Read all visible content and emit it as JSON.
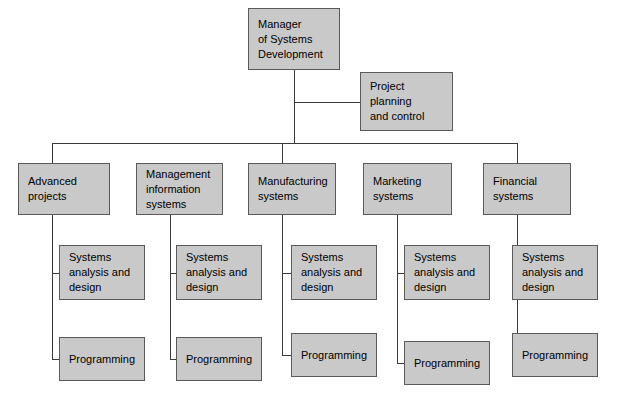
{
  "diagram": {
    "colors": {
      "box_fill": "#c9c9c9",
      "box_border": "#5a5a5a",
      "connector": "#3a3a3a",
      "background": "#ffffff",
      "text": "#000000"
    },
    "root": {
      "label_lines": [
        "Manager",
        "of Systems",
        "Development"
      ],
      "label": "Manager of Systems Development"
    },
    "staff": {
      "label_lines": [
        "Project",
        "planning",
        "and control"
      ],
      "label": "Project planning and control"
    },
    "divisions": [
      {
        "label": "Advanced projects",
        "label_lines": [
          "Advanced",
          "projects"
        ],
        "children": [
          {
            "label": "Systems analysis and design",
            "label_lines": [
              "Systems",
              "analysis and",
              "design"
            ]
          },
          {
            "label": "Programming",
            "label_lines": [
              "Programming"
            ]
          }
        ]
      },
      {
        "label": "Management information systems",
        "label_lines": [
          "Management",
          "information",
          "systems"
        ],
        "children": [
          {
            "label": "Systems analysis and design",
            "label_lines": [
              "Systems",
              "analysis and",
              "design"
            ]
          },
          {
            "label": "Programming",
            "label_lines": [
              "Programming"
            ]
          }
        ]
      },
      {
        "label": "Manufacturing systems",
        "label_lines": [
          "Manufacturing",
          "systems"
        ],
        "children": [
          {
            "label": "Systems analysis and design",
            "label_lines": [
              "Systems",
              "analysis and",
              "design"
            ]
          },
          {
            "label": "Programming",
            "label_lines": [
              "Programming"
            ]
          }
        ]
      },
      {
        "label": "Marketing systems",
        "label_lines": [
          "Marketing",
          "systems"
        ],
        "children": [
          {
            "label": "Systems analysis and design",
            "label_lines": [
              "Systems",
              "analysis and",
              "design"
            ]
          },
          {
            "label": "Programming",
            "label_lines": [
              "Programming"
            ]
          }
        ]
      },
      {
        "label": "Financial systems",
        "label_lines": [
          "Financial",
          "systems"
        ],
        "children": [
          {
            "label": "Systems analysis and design",
            "label_lines": [
              "Systems",
              "analysis and",
              "design"
            ]
          },
          {
            "label": "Programming",
            "label_lines": [
              "Programming"
            ]
          }
        ]
      }
    ]
  },
  "layout": {
    "root_box": {
      "x": 248,
      "y": 8,
      "w": 92,
      "h": 62
    },
    "staff_box": {
      "x": 360,
      "y": 72,
      "w": 93,
      "h": 59
    },
    "division_boxes": [
      {
        "x": 18,
        "y": 163,
        "w": 92,
        "h": 52
      },
      {
        "x": 136,
        "y": 163,
        "w": 87,
        "h": 52
      },
      {
        "x": 248,
        "y": 163,
        "w": 88,
        "h": 52
      },
      {
        "x": 363,
        "y": 163,
        "w": 89,
        "h": 52
      },
      {
        "x": 483,
        "y": 163,
        "w": 88,
        "h": 52
      }
    ],
    "analysis_boxes": [
      {
        "x": 59,
        "y": 245,
        "w": 86,
        "h": 55
      },
      {
        "x": 176,
        "y": 245,
        "w": 86,
        "h": 55
      },
      {
        "x": 291,
        "y": 245,
        "w": 86,
        "h": 55
      },
      {
        "x": 404,
        "y": 245,
        "w": 86,
        "h": 55
      },
      {
        "x": 512,
        "y": 245,
        "w": 86,
        "h": 55
      }
    ],
    "programming_boxes": [
      {
        "x": 59,
        "y": 337,
        "w": 86,
        "h": 44
      },
      {
        "x": 176,
        "y": 337,
        "w": 86,
        "h": 44
      },
      {
        "x": 291,
        "y": 333,
        "w": 86,
        "h": 44
      },
      {
        "x": 404,
        "y": 341,
        "w": 86,
        "h": 44
      },
      {
        "x": 512,
        "y": 333,
        "w": 86,
        "h": 44
      }
    ]
  }
}
